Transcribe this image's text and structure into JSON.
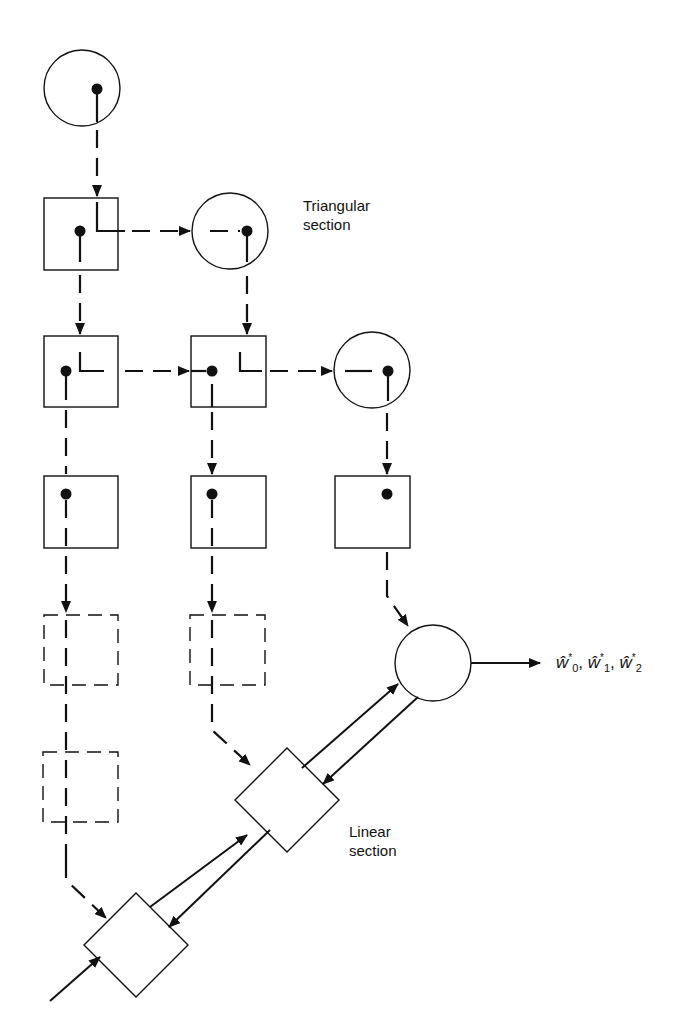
{
  "diagram": {
    "labels": {
      "triangular_line1": "Triangular",
      "triangular_line2": "section",
      "linear_line1": "Linear",
      "linear_line2": "section",
      "output": {
        "w0": "ŵ",
        "w0_sub": "0",
        "w0_sup": "*",
        "sep1": ", ",
        "w1": "ŵ",
        "w1_sub": "1",
        "w1_sup": "*",
        "sep2": ", ",
        "w2": "ŵ",
        "w2_sub": "2",
        "w2_sup": "*"
      }
    },
    "colors": {
      "stroke": "#111111",
      "background": "#ffffff"
    },
    "nodes": {
      "boundary_cells": [
        {
          "id": "circle-1",
          "cx": 82,
          "cy": 88,
          "r": 38
        },
        {
          "id": "circle-2",
          "cx": 230,
          "cy": 231,
          "r": 38
        },
        {
          "id": "circle-3",
          "cx": 372,
          "cy": 370,
          "r": 38
        }
      ],
      "internal_cells": [
        {
          "id": "box-2-1",
          "x": 44,
          "y": 198,
          "w": 74,
          "h": 72
        },
        {
          "id": "box-3-1",
          "x": 44,
          "y": 336,
          "w": 74,
          "h": 71
        },
        {
          "id": "box-3-2",
          "x": 191,
          "y": 336,
          "w": 75,
          "h": 71
        },
        {
          "id": "box-4-1",
          "x": 44,
          "y": 476,
          "w": 74,
          "h": 72
        },
        {
          "id": "box-4-2",
          "x": 191,
          "y": 476,
          "w": 75,
          "h": 72
        },
        {
          "id": "box-4-3",
          "x": 335,
          "y": 476,
          "w": 75,
          "h": 72
        }
      ],
      "dashed_cells": [
        {
          "id": "dbox-5-1",
          "x": 44,
          "y": 615,
          "w": 74,
          "h": 70
        },
        {
          "id": "dbox-5-2",
          "x": 190,
          "y": 615,
          "w": 75,
          "h": 70
        },
        {
          "id": "dbox-6-1",
          "x": 43,
          "y": 752,
          "w": 75,
          "h": 70
        }
      ],
      "linear_section": {
        "final_circle": {
          "cx": 433,
          "cy": 663,
          "r": 38
        },
        "diamonds": [
          {
            "id": "diamond-1",
            "cx": 287,
            "cy": 800,
            "half": 52
          },
          {
            "id": "diamond-2",
            "cx": 136,
            "cy": 945,
            "half": 52
          }
        ]
      }
    }
  }
}
